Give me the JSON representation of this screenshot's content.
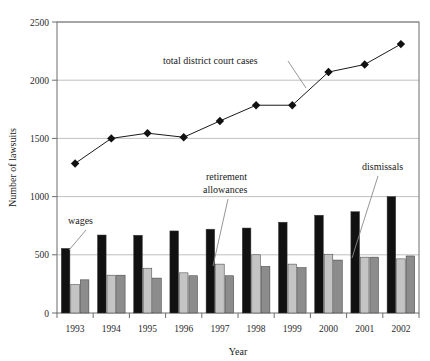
{
  "chart_data": {
    "type": "bar",
    "title": "",
    "xlabel": "Year",
    "ylabel": "Number of lawsuits",
    "categories": [
      "1993",
      "1994",
      "1995",
      "1996",
      "1997",
      "1998",
      "1999",
      "2000",
      "2001",
      "2002"
    ],
    "ylim": [
      0,
      2500
    ],
    "yticks": [
      0,
      500,
      1000,
      1500,
      2000,
      2500
    ],
    "ytick_labels": [
      "0",
      "500",
      "1000",
      "1500",
      "2000",
      "2500"
    ],
    "grid": true,
    "legend_position": "inline-annotations",
    "series": [
      {
        "name": "wages",
        "render": "bar",
        "color": "#111111",
        "values": [
          555,
          670,
          668,
          705,
          720,
          730,
          780,
          840,
          870,
          1000
        ]
      },
      {
        "name": "retirement allowances",
        "render": "bar",
        "color": "#c4c4c4",
        "values": [
          245,
          325,
          385,
          345,
          420,
          500,
          420,
          505,
          480,
          465
        ]
      },
      {
        "name": "dismissals",
        "render": "bar",
        "color": "#8c8c8c",
        "values": [
          285,
          325,
          300,
          320,
          320,
          400,
          390,
          455,
          480,
          490
        ]
      },
      {
        "name": "total district court cases",
        "render": "line",
        "color": "#111111",
        "marker": "diamond",
        "values": [
          1285,
          1500,
          1545,
          1510,
          1650,
          1785,
          1785,
          2070,
          2135,
          2310
        ]
      }
    ],
    "annotations": [
      {
        "text": "total district court cases",
        "target_series": "total district court cases"
      },
      {
        "text_line1": "retirement",
        "text_line2": "allowances",
        "target_series": "retirement allowances"
      },
      {
        "text": "dismissals",
        "target_series": "dismissals"
      },
      {
        "text": "wages",
        "target_series": "wages"
      }
    ]
  },
  "axes": {
    "y_title": "Number of lawsuits",
    "x_title": "Year"
  }
}
